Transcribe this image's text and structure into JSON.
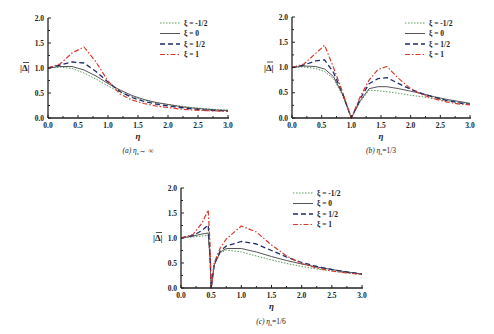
{
  "colors": {
    "xi_neg_half": "#5a9a5a",
    "xi_0": "#555555",
    "xi_half": "#1c2a6e",
    "xi_1": "#d6392b",
    "axis": "#222222"
  },
  "legend": [
    "ξ = -1/2",
    "ξ = 0",
    "ξ = 1/2",
    "ξ = 1"
  ],
  "ylabel": "|Δ̄|",
  "xlabel": "η",
  "chart_data": [
    {
      "type": "line",
      "title": "(a) η_s→ ∞",
      "xlabel": "η",
      "ylabel": "|Δ̄|",
      "xlim": [
        0,
        3.0
      ],
      "ylim": [
        0,
        2.0
      ],
      "xticks": [
        "0.0",
        "0.5",
        "1.0",
        "1.5",
        "2.0",
        "2.5",
        "3.0"
      ],
      "yticks": [
        "0.0",
        "0.5",
        "1.0",
        "1.5",
        "2.0"
      ],
      "legend_position": "upper right",
      "x": [
        0,
        0.2,
        0.4,
        0.6,
        0.8,
        1.0,
        1.2,
        1.4,
        1.6,
        1.8,
        2.0,
        2.2,
        2.4,
        2.6,
        2.8,
        3.0
      ],
      "series": [
        {
          "name": "ξ = -1/2",
          "values": [
            1.0,
            1.02,
            0.99,
            0.9,
            0.78,
            0.64,
            0.52,
            0.43,
            0.36,
            0.31,
            0.27,
            0.24,
            0.21,
            0.19,
            0.17,
            0.16
          ]
        },
        {
          "name": "ξ = 0",
          "values": [
            1.0,
            1.03,
            1.03,
            0.96,
            0.84,
            0.69,
            0.56,
            0.45,
            0.37,
            0.31,
            0.27,
            0.23,
            0.2,
            0.18,
            0.16,
            0.15
          ]
        },
        {
          "name": "ξ = 1/2",
          "values": [
            1.0,
            1.06,
            1.12,
            1.1,
            0.93,
            0.72,
            0.53,
            0.41,
            0.33,
            0.28,
            0.24,
            0.21,
            0.18,
            0.16,
            0.15,
            0.14
          ]
        },
        {
          "name": "ξ = 1",
          "values": [
            1.0,
            1.08,
            1.3,
            1.42,
            1.12,
            0.74,
            0.48,
            0.36,
            0.29,
            0.24,
            0.21,
            0.18,
            0.16,
            0.15,
            0.14,
            0.13
          ]
        }
      ]
    },
    {
      "type": "line",
      "title": "(b) η_s=1/3",
      "xlabel": "η",
      "ylabel": "|Δ̄|",
      "xlim": [
        0,
        3.0
      ],
      "ylim": [
        0,
        2.0
      ],
      "xticks": [
        "0.0",
        "0.5",
        "1.0",
        "1.5",
        "2.0",
        "2.5",
        "3.0"
      ],
      "yticks": [
        "0.0",
        "0.5",
        "1.0",
        "1.5",
        "2.0"
      ],
      "legend_position": "upper right",
      "x": [
        0,
        0.2,
        0.4,
        0.55,
        0.7,
        0.85,
        1.0,
        1.15,
        1.3,
        1.45,
        1.6,
        1.8,
        2.0,
        2.2,
        2.4,
        2.6,
        2.8,
        3.0
      ],
      "series": [
        {
          "name": "ξ = -1/2",
          "values": [
            1.0,
            1.01,
            0.98,
            0.92,
            0.78,
            0.45,
            0.0,
            0.32,
            0.55,
            0.54,
            0.52,
            0.49,
            0.45,
            0.42,
            0.38,
            0.35,
            0.31,
            0.28
          ]
        },
        {
          "name": "ξ = 0",
          "values": [
            1.0,
            1.03,
            1.02,
            0.97,
            0.82,
            0.48,
            0.0,
            0.34,
            0.58,
            0.62,
            0.62,
            0.58,
            0.53,
            0.48,
            0.42,
            0.37,
            0.33,
            0.29
          ]
        },
        {
          "name": "ξ = 1/2",
          "values": [
            1.0,
            1.05,
            1.13,
            1.15,
            0.9,
            0.5,
            0.0,
            0.38,
            0.68,
            0.78,
            0.8,
            0.68,
            0.57,
            0.48,
            0.41,
            0.35,
            0.3,
            0.27
          ]
        },
        {
          "name": "ξ = 1",
          "values": [
            1.0,
            1.07,
            1.28,
            1.44,
            1.0,
            0.52,
            0.0,
            0.42,
            0.75,
            0.96,
            1.02,
            0.78,
            0.58,
            0.46,
            0.38,
            0.32,
            0.28,
            0.26
          ]
        }
      ]
    },
    {
      "type": "line",
      "title": "(c) η_s=1/6",
      "xlabel": "η",
      "ylabel": "|Δ̄|",
      "xlim": [
        0,
        3.0
      ],
      "ylim": [
        0,
        2.0
      ],
      "xticks": [
        "0.0",
        "0.5",
        "1.0",
        "1.5",
        "2.0",
        "2.5",
        "3.0"
      ],
      "yticks": [
        "0.0",
        "0.5",
        "1.0",
        "1.5",
        "2.0"
      ],
      "legend_position": "upper right",
      "x": [
        0,
        0.2,
        0.35,
        0.45,
        0.48,
        0.5,
        0.55,
        0.65,
        0.75,
        1.0,
        1.25,
        1.5,
        1.75,
        2.0,
        2.25,
        2.5,
        2.75,
        3.0
      ],
      "series": [
        {
          "name": "ξ = -1/2",
          "values": [
            1.0,
            1.02,
            1.04,
            1.06,
            0.6,
            0.0,
            0.45,
            0.7,
            0.76,
            0.72,
            0.64,
            0.56,
            0.49,
            0.43,
            0.38,
            0.34,
            0.3,
            0.27
          ]
        },
        {
          "name": "ξ = 0",
          "values": [
            1.0,
            1.04,
            1.08,
            1.1,
            0.6,
            0.0,
            0.46,
            0.72,
            0.79,
            0.79,
            0.72,
            0.63,
            0.55,
            0.48,
            0.42,
            0.37,
            0.32,
            0.28
          ]
        },
        {
          "name": "ξ = 1/2",
          "values": [
            1.0,
            1.05,
            1.15,
            1.26,
            0.7,
            0.0,
            0.48,
            0.74,
            0.84,
            0.93,
            0.88,
            0.75,
            0.62,
            0.51,
            0.43,
            0.37,
            0.32,
            0.28
          ]
        },
        {
          "name": "ξ = 1",
          "values": [
            1.0,
            1.07,
            1.3,
            1.56,
            0.9,
            0.0,
            0.5,
            0.8,
            0.98,
            1.24,
            1.12,
            0.86,
            0.64,
            0.49,
            0.4,
            0.34,
            0.3,
            0.27
          ]
        }
      ]
    }
  ]
}
